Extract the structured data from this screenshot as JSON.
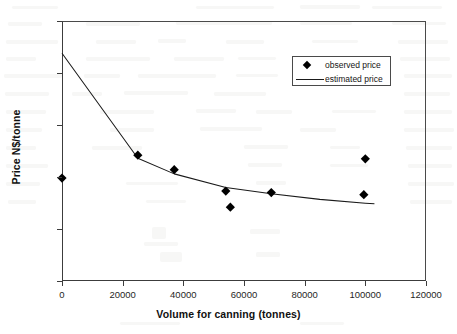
{
  "chart_data": {
    "type": "scatter",
    "title": "",
    "xlabel": "Volume for canning (tonnes)",
    "ylabel": "Price N$/tonne",
    "xlim": [
      0,
      120000
    ],
    "ylim": [
      0,
      2500
    ],
    "xticks": [
      0,
      20000,
      40000,
      60000,
      80000,
      100000,
      120000
    ],
    "xtick_labels": [
      "0",
      "20000",
      "40000",
      "60000",
      "80000",
      "100000",
      "120000"
    ],
    "yticks": [
      0,
      500,
      1000,
      1500,
      2000,
      2500
    ],
    "ytick_labels": [
      "0",
      "500",
      "1000",
      "1500",
      "2000",
      "2500"
    ],
    "grid": false,
    "legend_position": "upper right",
    "series": [
      {
        "name": "observed price",
        "type": "scatter",
        "marker": "diamond",
        "color": "#000000",
        "points": [
          {
            "x": 0,
            "y": 990
          },
          {
            "x": 25000,
            "y": 1210
          },
          {
            "x": 37000,
            "y": 1070
          },
          {
            "x": 54000,
            "y": 865
          },
          {
            "x": 55500,
            "y": 710
          },
          {
            "x": 69000,
            "y": 850
          },
          {
            "x": 100000,
            "y": 1175
          },
          {
            "x": 99500,
            "y": 830
          }
        ]
      },
      {
        "name": "estimated price",
        "type": "line",
        "color": "#1a1a1a",
        "points": [
          {
            "x": 0,
            "y": 2190
          },
          {
            "x": 25000,
            "y": 1180
          },
          {
            "x": 37000,
            "y": 1030
          },
          {
            "x": 54000,
            "y": 900
          },
          {
            "x": 69000,
            "y": 838
          },
          {
            "x": 85000,
            "y": 785
          },
          {
            "x": 100000,
            "y": 748
          },
          {
            "x": 103000,
            "y": 742
          }
        ]
      }
    ]
  },
  "legend": {
    "observed_label": "observed price",
    "estimated_label": "estimated price"
  }
}
